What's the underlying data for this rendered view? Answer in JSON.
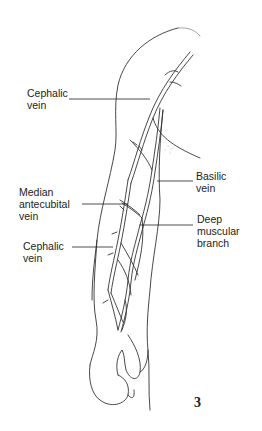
{
  "figure": {
    "number": "3",
    "labels": [
      {
        "id": "cephalic-upper",
        "text": "Cephalic\nvein"
      },
      {
        "id": "basilic",
        "text": "Basilic\nvein"
      },
      {
        "id": "median-antecubital",
        "text": "Median\nantecubital\nvein"
      },
      {
        "id": "deep-muscular",
        "text": "Deep\nmuscular\nbranch"
      },
      {
        "id": "cephalic-lower",
        "text": "Cephalic\nvein"
      }
    ]
  }
}
